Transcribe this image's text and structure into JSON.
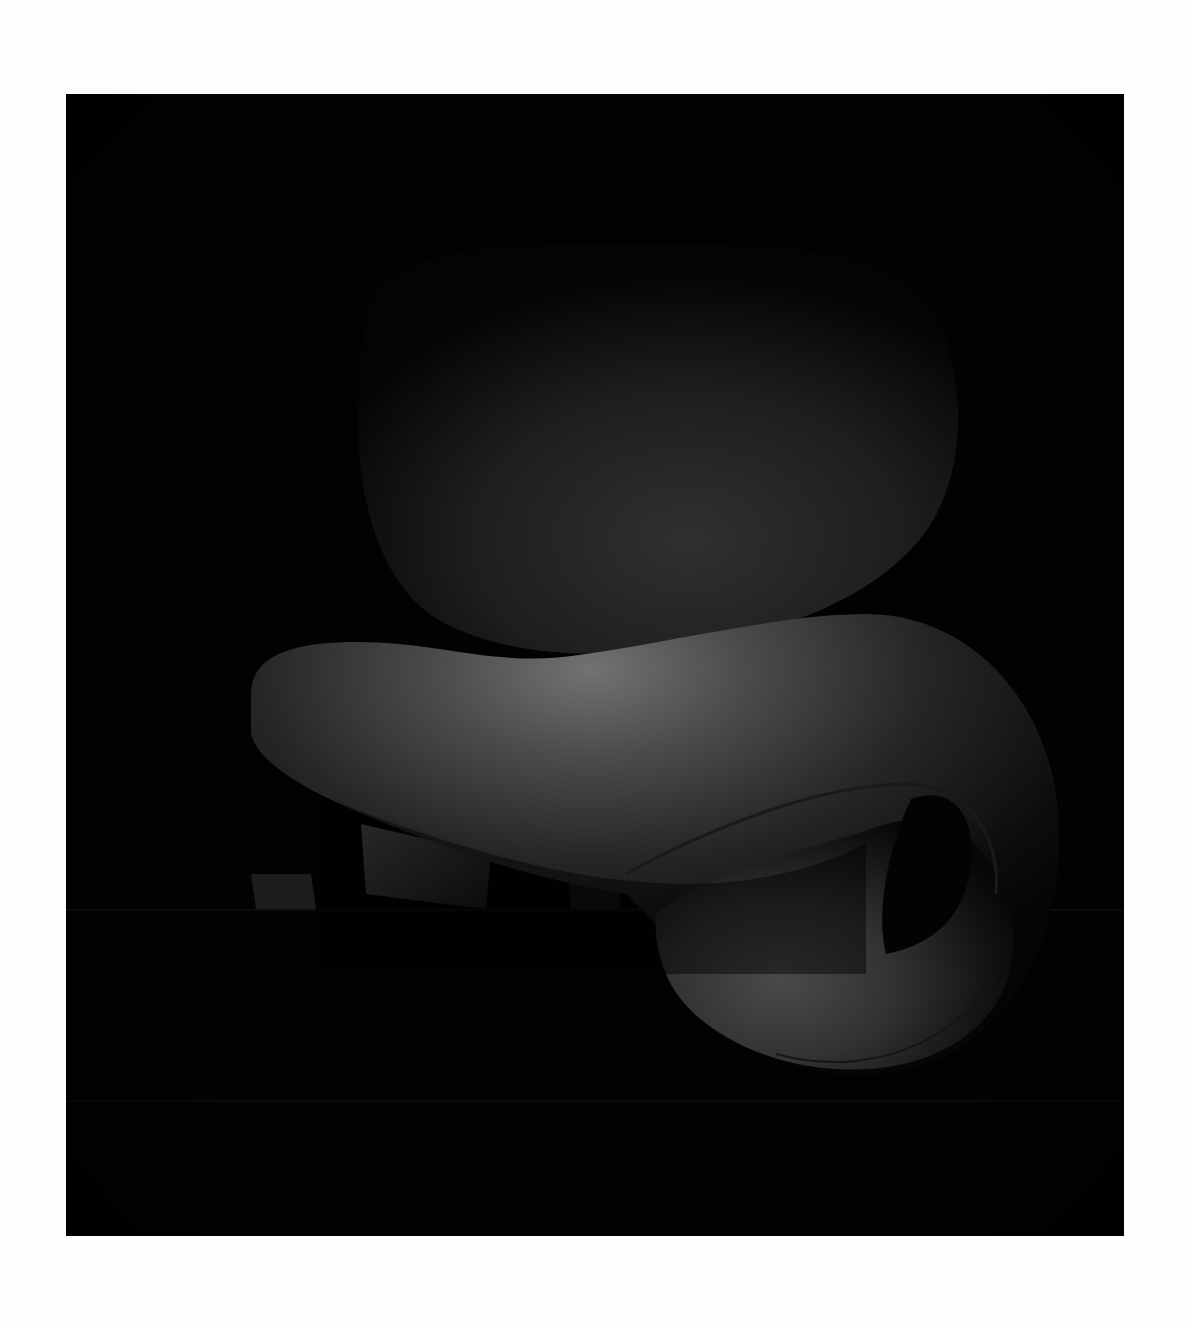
{
  "image": {
    "subject": "sculptural chair photograph",
    "alt": "Black-and-white photograph of an organic sculptural chair with a rounded backrest and a curling seat on a dark background",
    "colors": {
      "frame": "#fefefe",
      "background": "#020202",
      "backrest_highlight": "#2e2e2e",
      "seat_highlight": "#6a6a6a",
      "seat_mid": "#3a3a3a",
      "floor_line": "#0c0c0c"
    }
  }
}
